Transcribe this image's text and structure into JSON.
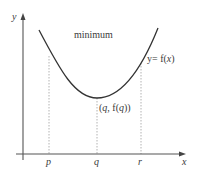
{
  "diagram": {
    "type": "function-graph",
    "axes": {
      "x_label": "x",
      "y_label": "y"
    },
    "curve": {
      "label": "y= f(x)",
      "label_parts": {
        "prefix": "y= f(",
        "var": "x",
        "suffix": ")"
      },
      "shape": "parabola-upward"
    },
    "annotation": "minimum",
    "point_label": "(q, f(q))",
    "point_parts": {
      "open": "(",
      "q": "q",
      "mid": ", f(",
      "q2": "q",
      "close": "))"
    },
    "ticks": [
      {
        "label": "p"
      },
      {
        "label": "q"
      },
      {
        "label": "r"
      }
    ],
    "colors": {
      "curve": "#333333",
      "axis": "#555555",
      "dashed": "#9a9a9a",
      "text": "#3a3a3a"
    }
  }
}
